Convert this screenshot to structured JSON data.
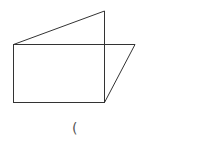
{
  "diagram": {
    "type": "geometric-figure",
    "stroke_color": "#333333",
    "background": "#ffffff",
    "shapes": {
      "rectangle": {
        "x1": 13,
        "y1": 44,
        "x2": 104,
        "y2": 102
      },
      "triangle_top": {
        "points": [
          [
            13,
            44
          ],
          [
            104,
            11
          ],
          [
            104,
            44
          ]
        ]
      },
      "parallelogram_side": {
        "points": [
          [
            104,
            44
          ],
          [
            135,
            44
          ],
          [
            104,
            102
          ]
        ]
      }
    },
    "caption": "("
  }
}
